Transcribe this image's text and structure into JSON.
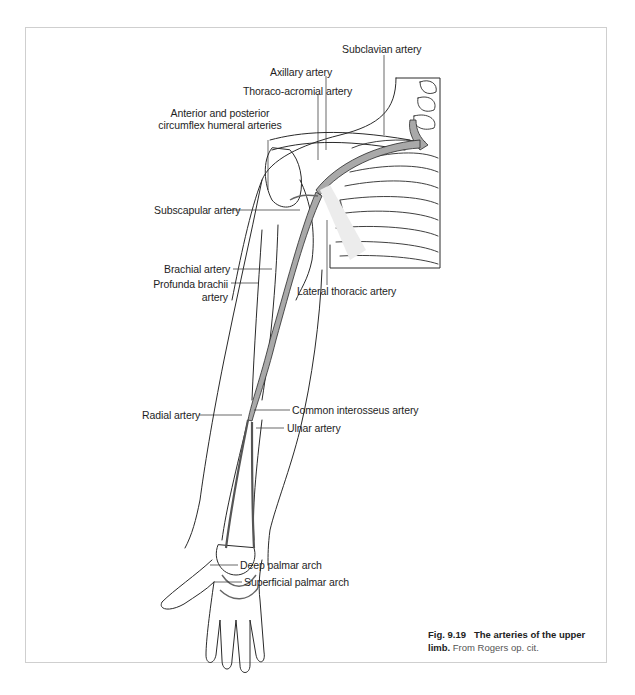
{
  "figure": {
    "labels": {
      "subclavian": "Subclavian artery",
      "axillary": "Axillary artery",
      "thoraco_acromial": "Thoraco-acromial artery",
      "circumflex_line1": "Anterior and posterior",
      "circumflex_line2": "circumflex humeral arteries",
      "subscapular": "Subscapular artery",
      "brachial": "Brachial artery",
      "profunda_line1": "Profunda brachii",
      "profunda_line2": "artery",
      "lateral_thoracic": "Lateral thoracic artery",
      "radial": "Radial artery",
      "common_interosseus": "Common interosseus artery",
      "ulnar": "Ulnar artery",
      "deep_palmar": "Deep palmar arch",
      "superficial_palmar": "Superficial palmar arch"
    },
    "caption": {
      "number": "Fig. 9.19",
      "title_part1": "The arteries of the upper",
      "title_part2": "limb.",
      "source": "From Rogers op. cit."
    },
    "colors": {
      "artery_fill": "#a9a9a9",
      "outline": "#2a2a2a",
      "frame_border": "#cfcfcf"
    }
  }
}
